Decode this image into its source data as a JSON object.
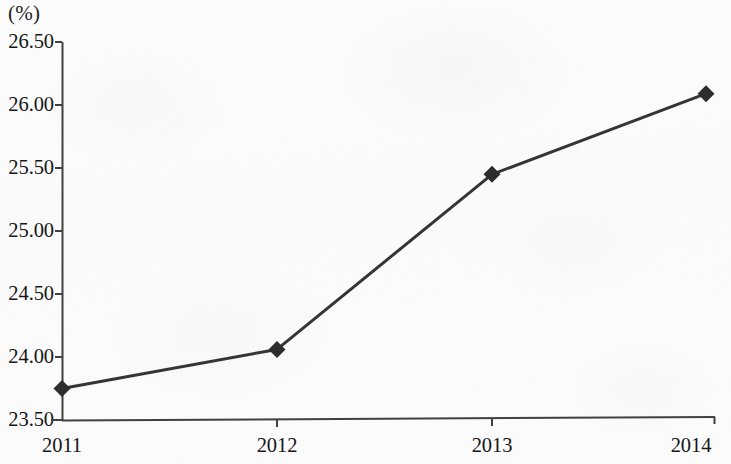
{
  "chart_data": {
    "type": "line",
    "title": "",
    "subtitle": "",
    "xlabel": "",
    "ylabel": "(%)",
    "unit_label": "(%)",
    "categories": [
      "2011",
      "2012",
      "2013",
      "2014"
    ],
    "x": [
      2011,
      2012,
      2013,
      2014
    ],
    "values": [
      23.75,
      24.06,
      25.45,
      26.09
    ],
    "series": [
      {
        "name": "",
        "values": [
          23.75,
          24.06,
          25.45,
          26.09
        ]
      }
    ],
    "ylim": [
      23.5,
      26.5
    ],
    "ytick_step": 0.5,
    "ytick_labels": [
      "23.50",
      "24.00",
      "24.50",
      "25.00",
      "25.50",
      "26.00",
      "26.50"
    ],
    "ytick_values": [
      23.5,
      24.0,
      24.5,
      25.0,
      25.5,
      26.0,
      26.5
    ],
    "xtick_labels": [
      "2011",
      "2012",
      "2013",
      "2014"
    ],
    "grid": false,
    "legend": false,
    "legend_position": "none",
    "marker": "diamond",
    "line_color": "#333333",
    "marker_color": "#2b2b2b",
    "axis_color": "#4a4a4a",
    "background_color": "#fcfcfc",
    "annotations": []
  },
  "axis": {
    "unit_label": "(%)",
    "y_labels": [
      "26.50",
      "26.00",
      "25.50",
      "25.00",
      "24.50",
      "24.00",
      "23.50"
    ],
    "x_labels": [
      "2011",
      "2012",
      "2013",
      "2014"
    ]
  }
}
